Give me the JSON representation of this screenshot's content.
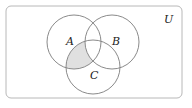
{
  "diagram": {
    "type": "venn",
    "universe_label": "U",
    "sets": [
      {
        "name": "A",
        "cx": 74,
        "cy": 42,
        "r": 27
      },
      {
        "name": "B",
        "cx": 112,
        "cy": 42,
        "r": 27
      },
      {
        "name": "C",
        "cx": 93,
        "cy": 67,
        "r": 27
      }
    ],
    "shaded_region": "A ∩ C ∩ B'",
    "colors": {
      "stroke": "#8a8a8a",
      "shade": "#e0e0e0",
      "border": "#b8b8b8"
    }
  }
}
